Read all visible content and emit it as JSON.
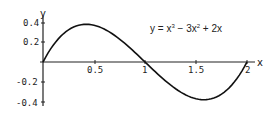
{
  "chart_data": {
    "type": "line",
    "title": "",
    "equation": "y = x^3 - 3x^2 + 2x",
    "equation_parts": {
      "y_eq": "y = x",
      "exp1": "3",
      "mid": " − 3x",
      "exp2": "2",
      "tail": " + 2x"
    },
    "xlabel": "x",
    "ylabel": "y",
    "xlim": [
      0,
      2
    ],
    "ylim": [
      -0.4,
      0.4
    ],
    "x_ticks": [
      "0.5",
      "1",
      "1.5",
      "2"
    ],
    "y_ticks": [
      "0.4",
      "0.2",
      "-0.2",
      "-0.4"
    ],
    "grid": false,
    "legend": null,
    "series": [
      {
        "name": "y = x^3 - 3x^2 + 2x",
        "x": [
          0,
          0.1,
          0.2,
          0.3,
          0.4,
          0.42,
          0.5,
          0.6,
          0.7,
          0.8,
          0.9,
          1.0,
          1.1,
          1.2,
          1.3,
          1.4,
          1.5,
          1.58,
          1.6,
          1.7,
          1.8,
          1.9,
          2.0
        ],
        "values": [
          0,
          0.171,
          0.288,
          0.357,
          0.384,
          0.385,
          0.375,
          0.336,
          0.273,
          0.192,
          0.099,
          0,
          -0.099,
          -0.192,
          -0.273,
          -0.336,
          -0.375,
          -0.385,
          -0.384,
          -0.357,
          -0.288,
          -0.171,
          0
        ]
      }
    ]
  }
}
